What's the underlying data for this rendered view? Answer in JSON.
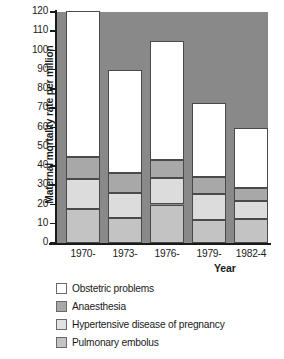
{
  "chart_data": {
    "type": "bar",
    "subtype": "stacked",
    "title": "",
    "xlabel": "Year",
    "ylabel": "Maternal mortality rate per million",
    "categories": [
      "1970-",
      "1973-",
      "1976-",
      "1979-",
      "1982-4"
    ],
    "ylim": [
      0,
      120
    ],
    "yticks": [
      0,
      10,
      20,
      30,
      40,
      50,
      60,
      70,
      80,
      90,
      100,
      110,
      120
    ],
    "grid": false,
    "legend_position": "below-plot",
    "stack_order_bottom_to_top": [
      "Pulmonary embolus",
      "Hypertensive disease of pregnancy",
      "Anaesthesia",
      "Obstetric problems"
    ],
    "series": [
      {
        "name": "Pulmonary embolus",
        "color": "#c3c3c3",
        "values": [
          17.5,
          13.0,
          20.0,
          12.0,
          12.5
        ]
      },
      {
        "name": "Hypertensive disease of pregnancy",
        "color": "#dcdcdc",
        "values": [
          15.5,
          13.0,
          14.0,
          13.5,
          9.5
        ]
      },
      {
        "name": "Anaesthesia",
        "color": "#a8a8a8",
        "values": [
          11.5,
          10.5,
          9.0,
          9.0,
          6.5
        ]
      },
      {
        "name": "Obstetric problems",
        "color": "#ffffff",
        "values": [
          76.0,
          53.5,
          62.0,
          38.0,
          31.0
        ]
      }
    ],
    "cumulative_tops": [
      [
        17.5,
        33.0,
        44.5,
        120.5
      ],
      [
        13.0,
        26.0,
        36.5,
        90.0
      ],
      [
        20.0,
        34.0,
        43.0,
        105.0
      ],
      [
        12.0,
        25.5,
        34.5,
        72.5
      ],
      [
        12.5,
        22.0,
        28.5,
        59.5
      ]
    ],
    "totals": [
      120.5,
      90.0,
      105.0,
      72.5,
      59.5
    ],
    "plot_background_color": "#898989"
  },
  "axis": {
    "y_title": "Maternal mortality rate per million",
    "x_title": "Year",
    "y_tick_labels": [
      "120",
      "110",
      "100",
      "90",
      "80",
      "70",
      "60",
      "50",
      "40",
      "30",
      "20",
      "10",
      "0"
    ],
    "x_tick_labels": [
      "1970-",
      "1973-",
      "1976-",
      "1979-",
      "1982-4"
    ]
  },
  "legend": {
    "items": [
      {
        "label": "Obstetric problems",
        "swatch": "obstetric"
      },
      {
        "label": "Anaesthesia",
        "swatch": "anaesthesia"
      },
      {
        "label": "Hypertensive disease of pregnancy",
        "swatch": "hypertensive"
      },
      {
        "label": "Pulmonary embolus",
        "swatch": "embolus"
      }
    ]
  }
}
